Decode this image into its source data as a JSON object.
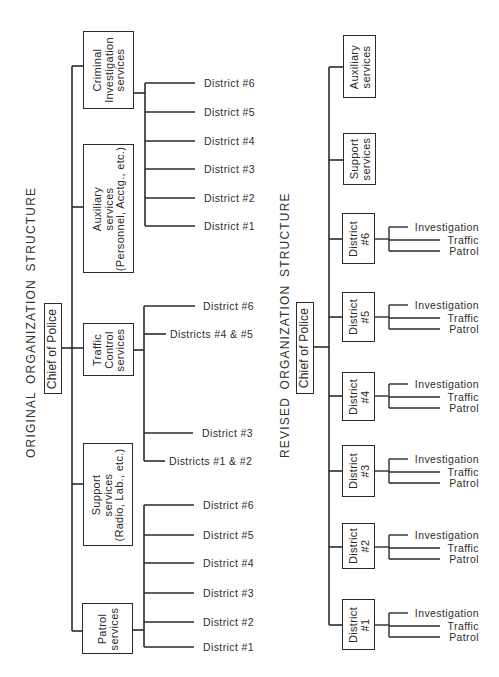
{
  "original": {
    "title": "ORIGINAL ORGANIZATION STRUCTURE",
    "root": "Chief of Police",
    "divisions": [
      {
        "lines": [
          "Criminal",
          "Investigation",
          "services"
        ],
        "children": [
          "District #6",
          "District #5",
          "District #4",
          "District #3",
          "District #2",
          "District #1"
        ]
      },
      {
        "lines": [
          "Auxiliary",
          "services",
          "(Personnel, Acctg., etc.)"
        ],
        "children": []
      },
      {
        "lines": [
          "Traffic",
          "Control",
          "services"
        ],
        "children": [
          "District #6",
          "Districts #4 & #5",
          "District #3",
          "Districts #1 & #2"
        ]
      },
      {
        "lines": [
          "Support",
          "services",
          "(Radio, Lab., etc.)"
        ],
        "children": []
      },
      {
        "lines": [
          "Patrol",
          "services"
        ],
        "children": [
          "District #6",
          "District #5",
          "District #4",
          "District #3",
          "District #2",
          "District #1"
        ]
      }
    ]
  },
  "revised": {
    "title": "REVISED ORGANIZATION STRUCTURE",
    "root": "Chief of Police",
    "divisions": [
      {
        "lines": [
          "Auxiliary",
          "services"
        ],
        "children": []
      },
      {
        "lines": [
          "Support",
          "services"
        ],
        "children": []
      },
      {
        "lines": [
          "District",
          "#6"
        ],
        "children": [
          "Investigation",
          "Traffic",
          "Patrol"
        ]
      },
      {
        "lines": [
          "District",
          "#5"
        ],
        "children": [
          "Investigation",
          "Traffic",
          "Patrol"
        ]
      },
      {
        "lines": [
          "District",
          "#4"
        ],
        "children": [
          "Investigation",
          "Traffic",
          "Patrol"
        ]
      },
      {
        "lines": [
          "District",
          "#3"
        ],
        "children": [
          "Investigation",
          "Traffic",
          "Patrol"
        ]
      },
      {
        "lines": [
          "District",
          "#2"
        ],
        "children": [
          "Investigation",
          "Traffic",
          "Patrol"
        ]
      },
      {
        "lines": [
          "District",
          "#1"
        ],
        "children": [
          "Investigation",
          "Traffic",
          "Patrol"
        ]
      }
    ]
  }
}
